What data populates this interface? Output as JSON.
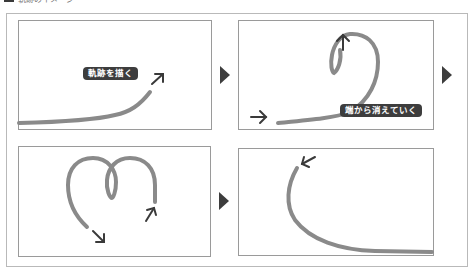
{
  "heading": {
    "text": "軌跡のイメージ"
  },
  "colors": {
    "trail": "#8a8a8a",
    "arrow": "#3a3a3a",
    "label_bg": "#3d3d3d",
    "label_fg": "#ffffff",
    "panel_border": "#9a9a9a"
  },
  "panels": [
    {
      "id": 1,
      "label": "軌跡を描く",
      "description": "trail being drawn upward-right"
    },
    {
      "id": 2,
      "label": "端から消えていく",
      "description": "trail loops and starts fading from the tail"
    },
    {
      "id": 3,
      "label": "",
      "description": "double loop trail with direction arrows"
    },
    {
      "id": 4,
      "label": "",
      "description": "remaining trail arc curving up-left"
    }
  ],
  "step_arrows": [
    "next-step",
    "next-step",
    "next-step"
  ]
}
